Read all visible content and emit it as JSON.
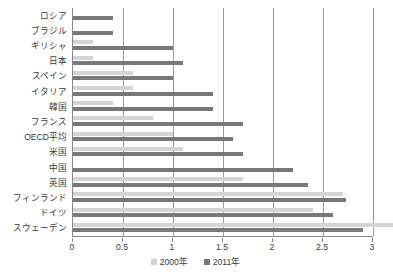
{
  "chart_data": {
    "type": "bar",
    "orientation": "horizontal",
    "title": "",
    "xlabel": "",
    "ylabel": "",
    "xlim": [
      0,
      3
    ],
    "xticks": [
      0,
      0.5,
      1,
      1.5,
      2,
      2.5,
      3
    ],
    "xticklabels": [
      "0",
      "0.5",
      "1",
      "1.5",
      "2",
      "2.5",
      "3"
    ],
    "grid": true,
    "legend_position": "bottom",
    "categories": [
      "ロシア",
      "ブラジル",
      "ギリシャ",
      "日本",
      "スペイン",
      "イタリア",
      "韓国",
      "フランス",
      "OECD平均",
      "米国",
      "中国",
      "英国",
      "フィンランド",
      "ドイツ",
      "スウェーデン"
    ],
    "series": [
      {
        "name": "2000年",
        "color": "#d4d4d4",
        "values": [
          0.0,
          0.0,
          0.2,
          0.2,
          0.6,
          0.6,
          0.4,
          0.8,
          1.0,
          1.1,
          0.0,
          1.7,
          2.7,
          2.4,
          3.2
        ]
      },
      {
        "name": "2011年",
        "color": "#787878",
        "values": [
          0.4,
          0.4,
          1.0,
          1.1,
          1.0,
          1.4,
          1.4,
          1.7,
          1.6,
          1.7,
          2.2,
          2.35,
          2.73,
          2.6,
          2.9
        ]
      }
    ]
  },
  "legend": {
    "items": [
      {
        "label": "2000年"
      },
      {
        "label": "2011年"
      }
    ]
  }
}
